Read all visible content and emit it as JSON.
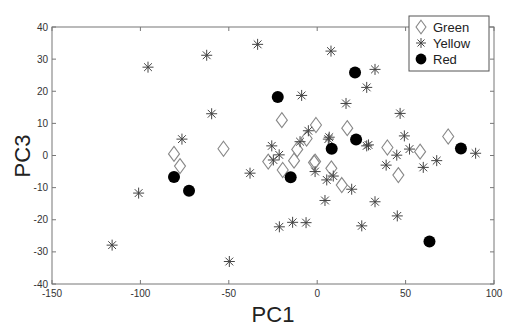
{
  "chart_data": {
    "type": "scatter",
    "title": "",
    "xlabel": "PC1",
    "ylabel": "PC3",
    "xlim": [
      -150,
      100
    ],
    "ylim": [
      -40,
      40
    ],
    "xticks": [
      -150,
      -100,
      -50,
      0,
      50,
      100
    ],
    "yticks": [
      -40,
      -30,
      -20,
      -10,
      0,
      10,
      20,
      30,
      40
    ],
    "grid": false,
    "legend_position": "top-right",
    "series": [
      {
        "name": "Green",
        "marker": "diamond-open",
        "color": "#888888",
        "points": [
          [
            -81,
            0.5
          ],
          [
            -77.6,
            -3.3
          ],
          [
            -53,
            2.1
          ],
          [
            -20,
            11
          ],
          [
            -0.7,
            9.5
          ],
          [
            -6,
            5.3
          ],
          [
            -11.3,
            1.9
          ],
          [
            -27.7,
            -1.9
          ],
          [
            -13.1,
            -1.6
          ],
          [
            -1.2,
            -1.9
          ],
          [
            -19.5,
            -4.5
          ],
          [
            -1.8,
            -2.2
          ],
          [
            13.9,
            -9.2
          ],
          [
            17,
            8.5
          ],
          [
            39.7,
            2.5
          ],
          [
            58.2,
            1.2
          ],
          [
            45.9,
            -6.1
          ],
          [
            74.1,
            5.9
          ],
          [
            8,
            -4
          ]
        ]
      },
      {
        "name": "Yellow",
        "marker": "asterisk",
        "color": "#444444",
        "points": [
          [
            -95.7,
            27.5
          ],
          [
            -76.5,
            5.1
          ],
          [
            -101,
            -11.7
          ],
          [
            -116,
            -27.9
          ],
          [
            -62.5,
            31.2
          ],
          [
            -33.7,
            34.6
          ],
          [
            7.8,
            32.5
          ],
          [
            -8.8,
            18.7
          ],
          [
            -59.7,
            13
          ],
          [
            -5,
            7.7
          ],
          [
            -9.7,
            4.3
          ],
          [
            6.8,
            5.7
          ],
          [
            -25.7,
            3
          ],
          [
            -21.5,
            0.2
          ],
          [
            -24.8,
            -1.4
          ],
          [
            -38,
            -5.5
          ],
          [
            -1.2,
            -5
          ],
          [
            29,
            3.3
          ],
          [
            45,
            0.1
          ],
          [
            39,
            -3
          ],
          [
            5.4,
            -7.6
          ],
          [
            9.1,
            -6.4
          ],
          [
            19.5,
            -10.5
          ],
          [
            4.4,
            -14
          ],
          [
            32.7,
            -14.4
          ],
          [
            45.3,
            -18.8
          ],
          [
            -6.3,
            -20.9
          ],
          [
            -13.9,
            -20.8
          ],
          [
            -21.4,
            -22.2
          ],
          [
            25.2,
            -21.9
          ],
          [
            -49.7,
            -33
          ],
          [
            32.7,
            26.8
          ],
          [
            28,
            21.2
          ],
          [
            16.3,
            16.2
          ],
          [
            46.9,
            13.1
          ],
          [
            49.3,
            6.1
          ],
          [
            52.2,
            2
          ],
          [
            89.6,
            0.7
          ],
          [
            67.6,
            -1.6
          ],
          [
            60,
            -3.7
          ],
          [
            6.3,
            5.1
          ],
          [
            28,
            3
          ]
        ]
      },
      {
        "name": "Red",
        "marker": "circle-filled",
        "color": "#000000",
        "points": [
          [
            -81,
            -6.7
          ],
          [
            -72.5,
            -11
          ],
          [
            -22.3,
            18.2
          ],
          [
            -15,
            -6.8
          ],
          [
            8.2,
            2.1
          ],
          [
            22,
            5
          ],
          [
            21.4,
            25.8
          ],
          [
            81.3,
            2.2
          ],
          [
            63.5,
            -26.8
          ]
        ]
      }
    ]
  },
  "legend": {
    "items": [
      {
        "label": "Green",
        "marker": "diamond-open"
      },
      {
        "label": "Yellow",
        "marker": "asterisk"
      },
      {
        "label": "Red",
        "marker": "circle-filled"
      }
    ]
  }
}
